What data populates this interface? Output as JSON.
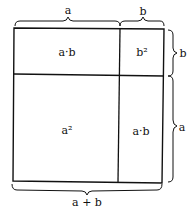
{
  "diagram": {
    "title": "",
    "top_labels": {
      "a": "a",
      "b": "b"
    },
    "right_labels": {
      "b": "b",
      "a": "a"
    },
    "bottom_label": "a + b",
    "cells": {
      "top_left": "a·b",
      "top_right": "b²",
      "bottom_left": "a²",
      "bottom_right": "a·b"
    },
    "colors": {
      "line": "#111111",
      "background": "#ffffff"
    }
  }
}
